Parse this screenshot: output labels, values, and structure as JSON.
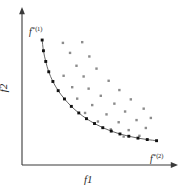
{
  "figure": {
    "background_color": "#ffffff",
    "axis_color": "#3a3a3a",
    "curve_color": "#555555",
    "pareto_point_color": "#111111",
    "dominated_point_color": "#8c8c8c"
  },
  "labels": {
    "x_axis": "f1",
    "y_axis": "f2",
    "pareto_end_top": {
      "base": "f",
      "star": "*",
      "index": "(1)"
    },
    "pareto_end_bottom": {
      "base": "f",
      "star": "*",
      "index": "(2)"
    }
  },
  "chart_data": {
    "type": "scatter",
    "title": "",
    "xlabel": "f1",
    "ylabel": "f2",
    "xlim": [
      0,
      100
    ],
    "ylim": [
      0,
      100
    ],
    "grid": false,
    "legend": null,
    "annotations": [
      {
        "text": "f*(1)",
        "x": 12,
        "y": 90,
        "role": "pareto-extreme-point-1"
      },
      {
        "text": "f*(2)",
        "x": 92,
        "y": 8,
        "role": "pareto-extreme-point-2"
      }
    ],
    "series": [
      {
        "name": "Pareto front",
        "type": "line-with-markers",
        "color": "#111111",
        "x": [
          12.0,
          12.9,
          14.5,
          16.6,
          19.5,
          23.2,
          27.6,
          32.4,
          37.6,
          43.0,
          48.6,
          54.4,
          60.3,
          66.4,
          72.6,
          79.0,
          85.5,
          92.0
        ],
        "y": [
          86.0,
          78.5,
          71.0,
          63.8,
          57.0,
          50.6,
          44.8,
          39.6,
          35.0,
          31.0,
          27.6,
          24.7,
          22.3,
          20.3,
          18.7,
          17.4,
          16.4,
          15.6
        ]
      },
      {
        "name": "Dominated solutions",
        "type": "scatter",
        "color": "#8c8c8c",
        "x": [
          26.5,
          40.0,
          31.5,
          45.0,
          36.0,
          27.0,
          41.0,
          50.0,
          33.0,
          44.5,
          58.5,
          36.5,
          53.0,
          66.0,
          47.0,
          62.5,
          74.0,
          42.0,
          57.0,
          70.0,
          83.0,
          51.0,
          65.5,
          78.0,
          88.0,
          60.0,
          72.5,
          84.5,
          69.0,
          80.0
        ],
        "y": [
          84.0,
          84.5,
          77.0,
          74.5,
          68.0,
          61.0,
          60.5,
          66.0,
          53.0,
          52.0,
          57.5,
          45.0,
          47.0,
          51.0,
          40.5,
          41.5,
          44.5,
          35.0,
          34.0,
          36.0,
          38.0,
          29.0,
          28.5,
          30.0,
          31.5,
          23.5,
          23.0,
          24.5,
          18.5,
          19.0
        ]
      }
    ]
  }
}
